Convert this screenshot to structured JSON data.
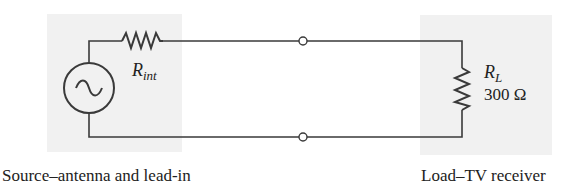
{
  "diagram": {
    "type": "circuit",
    "source_block": {
      "caption": "Source–antenna and lead-in",
      "source_symbol": "ac-voltage-source",
      "internal_resistor": {
        "symbol": "R",
        "subscript": "int"
      }
    },
    "load_block": {
      "caption": "Load–TV receiver",
      "load_resistor": {
        "symbol": "R",
        "subscript": "L",
        "value": "300 Ω"
      }
    },
    "terminals": 2,
    "colors": {
      "wire": "#3a3a3a",
      "shade": "#f1f1f1",
      "text": "#222222"
    }
  }
}
